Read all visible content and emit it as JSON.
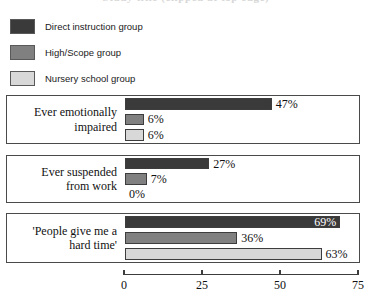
{
  "title": "Study title (clipped at top edge)",
  "legend": {
    "position": "top-left",
    "items": [
      {
        "label": "Direct instruction group",
        "color": "#3a3a3a",
        "swatch_name": "legend-swatch-direct-instruction"
      },
      {
        "label": "High/Scope group",
        "color": "#808080",
        "swatch_name": "legend-swatch-highscope"
      },
      {
        "label": "Nursery school group",
        "color": "#d8d8d8",
        "swatch_name": "legend-swatch-nursery-school"
      }
    ]
  },
  "axis": {
    "ticks": [
      "0",
      "25",
      "50",
      "75"
    ],
    "min": 0,
    "max": 75
  },
  "chart_data": {
    "type": "bar",
    "orientation": "horizontal",
    "title": "Study title (clipped at top edge)",
    "xlabel": "",
    "ylabel": "",
    "xlim": [
      0,
      75
    ],
    "grid": false,
    "legend_position": "top-left",
    "categories": [
      "Ever emotionally impaired",
      "Ever suspended from work",
      "'People give me a hard time'"
    ],
    "series": [
      {
        "name": "Direct instruction group",
        "color": "#3a3a3a",
        "values": [
          47,
          27,
          69
        ],
        "labels": [
          "47%",
          "27%",
          "69%"
        ]
      },
      {
        "name": "High/Scope group",
        "color": "#808080",
        "values": [
          6,
          7,
          36
        ],
        "labels": [
          "6%",
          "7%",
          "36%"
        ]
      },
      {
        "name": "Nursery school group",
        "color": "#d8d8d8",
        "values": [
          6,
          0,
          63
        ],
        "labels": [
          "6%",
          "0%",
          "63%"
        ]
      }
    ]
  },
  "panels": [
    {
      "label_line1": "Ever emotionally",
      "label_line2": "impaired",
      "bars": [
        {
          "series": "Direct instruction group",
          "value": 47,
          "label": "47%",
          "color": "#3a3a3a",
          "label_inside": false
        },
        {
          "series": "High/Scope group",
          "value": 6,
          "label": "6%",
          "color": "#808080",
          "label_inside": false
        },
        {
          "series": "Nursery school group",
          "value": 6,
          "label": "6%",
          "color": "#d8d8d8",
          "label_inside": false
        }
      ]
    },
    {
      "label_line1": "Ever suspended",
      "label_line2": "from work",
      "bars": [
        {
          "series": "Direct instruction group",
          "value": 27,
          "label": "27%",
          "color": "#3a3a3a",
          "label_inside": false
        },
        {
          "series": "High/Scope group",
          "value": 7,
          "label": "7%",
          "color": "#808080",
          "label_inside": false
        },
        {
          "series": "Nursery school group",
          "value": 0,
          "label": "0%",
          "color": "#d8d8d8",
          "label_inside": false
        }
      ]
    },
    {
      "label_line1": "'People give me a",
      "label_line2": "hard time'",
      "bars": [
        {
          "series": "Direct instruction group",
          "value": 69,
          "label": "69%",
          "color": "#3a3a3a",
          "label_inside": true
        },
        {
          "series": "High/Scope group",
          "value": 36,
          "label": "36%",
          "color": "#808080",
          "label_inside": false
        },
        {
          "series": "Nursery school group",
          "value": 63,
          "label": "63%",
          "color": "#d8d8d8",
          "label_inside": false
        }
      ]
    }
  ]
}
